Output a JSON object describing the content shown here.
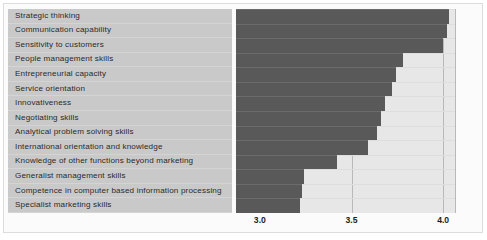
{
  "chart_data": {
    "type": "bar",
    "orientation": "horizontal",
    "title": "",
    "xlabel": "",
    "ylabel": "",
    "xlim": [
      2.87,
      4.07
    ],
    "grid": true,
    "legend": null,
    "tick_labels": [
      "3.0",
      "3.5",
      "4.0"
    ],
    "tick_values": [
      3.0,
      3.5,
      4.0
    ],
    "categories": [
      "Strategic thinking",
      "Communication capability",
      "Sensitivity to customers",
      "People management skills",
      "Entrepreneurial capacity",
      "Service orientation",
      "Innovativeness",
      "Negotiating skills",
      "Analytical problem solving skills",
      "International orientation and knowledge",
      "Knowledge of other functions beyond marketing",
      "Generalist management skills",
      "Competence in computer based information processing",
      "Specialist marketing skills"
    ],
    "values": [
      4.03,
      4.02,
      4.0,
      3.78,
      3.74,
      3.72,
      3.68,
      3.66,
      3.64,
      3.59,
      3.42,
      3.24,
      3.23,
      3.22
    ]
  },
  "style": {
    "bar_color": "#595959",
    "label_panel_color": "#c9c9c9",
    "plot_background": "#e7e7e7",
    "gridline_color": "#b9b9b9",
    "text_color": "#2a2a2a",
    "frame_color": "#dcdcdc"
  }
}
